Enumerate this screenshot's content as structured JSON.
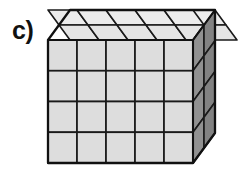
{
  "figure": {
    "label": "c)",
    "type": "isometric-cube-grid",
    "background_color": "#ffffff"
  },
  "geometry": {
    "columns": 5,
    "rows": 4,
    "depth": 2,
    "total_unit_cubes": 40,
    "front_face": {
      "origin_x": 48,
      "origin_y": 40,
      "width": 145,
      "height": 123,
      "cell_width": 29,
      "cell_height": 30.75,
      "fill_color": "#dcdcdc"
    },
    "top_face": {
      "fill_color": "#e8e8e8",
      "rows": 2
    },
    "right_face": {
      "fill_color": "#8d8d8d",
      "columns": 2
    },
    "depth_offset": {
      "dx": 22,
      "dy": -30
    },
    "stroke_color": "#1a1a1a",
    "stroke_width_outer": 2.2,
    "stroke_width_inner": 1.8
  }
}
